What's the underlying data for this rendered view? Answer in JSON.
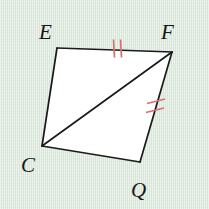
{
  "figure": {
    "kind": "geometry-diagram",
    "background_color": "#dde8dd",
    "interior_fill": "#ffffff",
    "stroke_color": "#1a1a1a",
    "tick_color": "#d9706e",
    "stroke_width": 1.7,
    "tick_width": 1.7
  },
  "vertices": [
    {
      "id": "E",
      "label": "E",
      "x": 57,
      "y": 48,
      "label_x": 39,
      "label_y": 22
    },
    {
      "id": "F",
      "label": "F",
      "x": 172,
      "y": 52,
      "label_x": 161,
      "label_y": 22
    },
    {
      "id": "Q",
      "label": "Q",
      "x": 140,
      "y": 162,
      "label_x": 131,
      "label_y": 180
    },
    {
      "id": "C",
      "label": "C",
      "x": 42,
      "y": 146,
      "label_x": 21,
      "label_y": 155
    }
  ],
  "polygon": {
    "name": "quadrilateral-EFQC",
    "points": "57,48 172,52 140,162 42,146"
  },
  "segments": [
    {
      "name": "segment-EF",
      "from": "E",
      "to": "F",
      "x1": 57,
      "y1": 48,
      "x2": 172,
      "y2": 52,
      "ticks": 2,
      "tick_style": "perpendicular"
    },
    {
      "name": "segment-FQ",
      "from": "F",
      "to": "Q",
      "x1": 172,
      "y1": 52,
      "x2": 140,
      "y2": 162,
      "ticks": 2,
      "tick_style": "slanted"
    },
    {
      "name": "segment-QC",
      "from": "Q",
      "to": "C",
      "x1": 140,
      "y1": 162,
      "x2": 42,
      "y2": 146,
      "ticks": 0,
      "tick_style": "none"
    },
    {
      "name": "segment-CE",
      "from": "C",
      "to": "E",
      "x1": 42,
      "y1": 146,
      "x2": 57,
      "y2": 48,
      "ticks": 0,
      "tick_style": "none"
    },
    {
      "name": "segment-CF-diagonal",
      "from": "C",
      "to": "F",
      "x1": 42,
      "y1": 146,
      "x2": 172,
      "y2": 52,
      "ticks": 0,
      "tick_style": "none"
    }
  ],
  "tick_marks": [
    {
      "name": "tick-mark-EF-1",
      "x1": 113.5,
      "y1": 39.5,
      "x2": 114.5,
      "y2": 57.5
    },
    {
      "name": "tick-mark-EF-2",
      "x1": 120.5,
      "y1": 39.5,
      "x2": 121.5,
      "y2": 57.5
    },
    {
      "name": "tick-mark-FQ-1",
      "x1": 147.0,
      "y1": 103.5,
      "x2": 165.0,
      "y2": 99.0
    },
    {
      "name": "tick-mark-FQ-2",
      "x1": 146.0,
      "y1": 112.5,
      "x2": 164.0,
      "y2": 108.0
    }
  ]
}
